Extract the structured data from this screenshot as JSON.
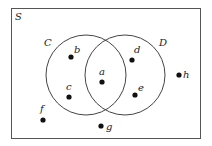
{
  "diagram": {
    "type": "venn",
    "universe": {
      "label": "S",
      "x": 11,
      "y": 8,
      "width": 189,
      "height": 130
    },
    "sets": [
      {
        "label": "C",
        "cx": 86,
        "cy": 75,
        "r": 40,
        "label_x": 44,
        "label_y": 46
      },
      {
        "label": "D",
        "cx": 125,
        "cy": 75,
        "r": 40,
        "label_x": 159,
        "label_y": 46
      }
    ],
    "points": [
      {
        "label": "a",
        "x": 102,
        "y": 82,
        "lx": 99,
        "ly": 75,
        "region": "C∩D"
      },
      {
        "label": "b",
        "x": 71,
        "y": 57,
        "lx": 74,
        "ly": 53,
        "region": "C only"
      },
      {
        "label": "c",
        "x": 69,
        "y": 97,
        "lx": 66,
        "ly": 90,
        "region": "C only"
      },
      {
        "label": "d",
        "x": 132,
        "y": 60,
        "lx": 134,
        "ly": 53,
        "region": "D only"
      },
      {
        "label": "e",
        "x": 135,
        "y": 95,
        "lx": 138,
        "ly": 91,
        "region": "D only"
      },
      {
        "label": "f",
        "x": 43,
        "y": 120,
        "lx": 40,
        "ly": 112,
        "region": "outside"
      },
      {
        "label": "g",
        "x": 101,
        "y": 126,
        "lx": 106,
        "ly": 130,
        "region": "outside"
      },
      {
        "label": "h",
        "x": 179,
        "y": 75,
        "lx": 183,
        "ly": 78,
        "region": "outside"
      }
    ]
  }
}
